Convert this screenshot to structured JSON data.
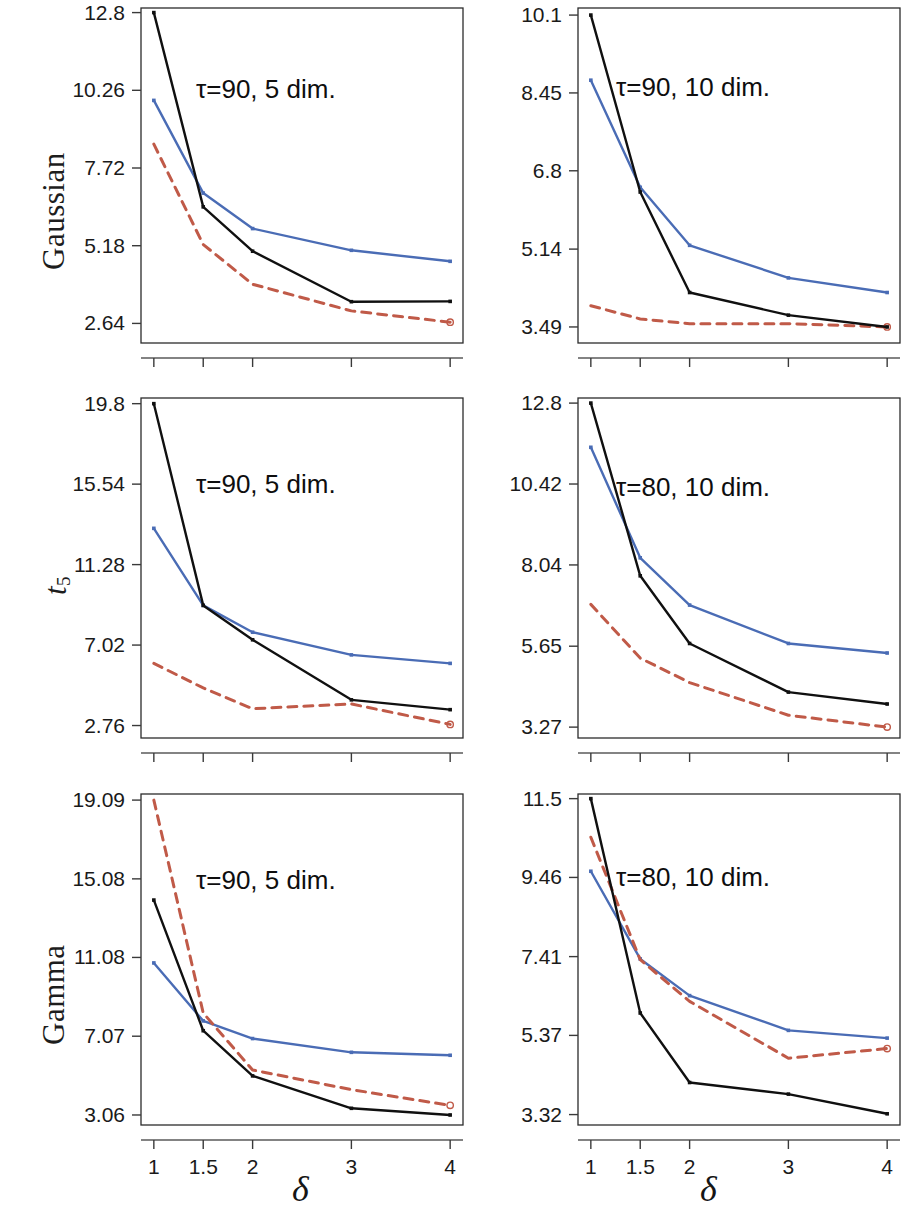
{
  "figure": {
    "row_labels": [
      "Gaussian",
      "t5",
      "Gamma"
    ],
    "x_axis_title": "δ",
    "colors": {
      "black": "#101010",
      "blue": "#4a6cb5",
      "red_dashed": "#c05a48",
      "frame": "#2b2b2b"
    }
  },
  "chart_data": [
    {
      "id": "gaussian-5dim",
      "type": "line",
      "row": "Gaussian",
      "column": "left",
      "title": "τ=90, 5 dim.",
      "xlabel": "δ",
      "ylabel": "",
      "x": [
        1,
        1.5,
        2,
        3,
        4
      ],
      "xtick_labels": [
        "1",
        "1.5",
        "2",
        "3",
        "4"
      ],
      "ytick_labels": [
        "2.64",
        "5.18",
        "7.72",
        "10.26",
        "12.8"
      ],
      "ytick_values": [
        2.64,
        5.18,
        7.72,
        10.26,
        12.8
      ],
      "ylim": [
        2.0,
        12.95
      ],
      "xlim": [
        0.87,
        4.13
      ],
      "grid": false,
      "legend": "none",
      "series": [
        {
          "name": "black-solid",
          "style": "solid",
          "color": "#101010",
          "values": [
            12.8,
            6.45,
            5.0,
            3.35,
            3.36
          ]
        },
        {
          "name": "blue-solid",
          "style": "solid",
          "color": "#4a6cb5",
          "values": [
            9.93,
            6.9,
            5.74,
            5.03,
            4.67
          ]
        },
        {
          "name": "red-dashed",
          "style": "dashed",
          "color": "#c05a48",
          "values": [
            8.5,
            5.22,
            3.92,
            3.05,
            2.68
          ]
        }
      ]
    },
    {
      "id": "gaussian-10dim",
      "type": "line",
      "row": "Gaussian",
      "column": "right",
      "title": "τ=90, 10 dim.",
      "xlabel": "δ",
      "ylabel": "",
      "x": [
        1,
        1.5,
        2,
        3,
        4
      ],
      "xtick_labels": [
        "1",
        "1.5",
        "2",
        "3",
        "4"
      ],
      "ytick_labels": [
        "3.49",
        "5.14",
        "6.8",
        "8.45",
        "10.1"
      ],
      "ytick_values": [
        3.49,
        5.14,
        6.8,
        8.45,
        10.1
      ],
      "ylim": [
        3.15,
        10.25
      ],
      "xlim": [
        0.87,
        4.13
      ],
      "grid": false,
      "legend": "none",
      "series": [
        {
          "name": "black-solid",
          "style": "solid",
          "color": "#101010",
          "values": [
            10.1,
            6.35,
            4.22,
            3.74,
            3.49
          ]
        },
        {
          "name": "blue-solid",
          "style": "solid",
          "color": "#4a6cb5",
          "values": [
            8.72,
            6.45,
            5.22,
            4.53,
            4.22
          ]
        },
        {
          "name": "red-dashed",
          "style": "dashed",
          "color": "#c05a48",
          "values": [
            3.94,
            3.66,
            3.56,
            3.56,
            3.49
          ]
        }
      ]
    },
    {
      "id": "t5-5dim",
      "type": "line",
      "row": "t5",
      "column": "left",
      "title": "τ=90, 5 dim.",
      "xlabel": "δ",
      "ylabel": "",
      "x": [
        1,
        1.5,
        2,
        3,
        4
      ],
      "xtick_labels": [
        "1",
        "1.5",
        "2",
        "3",
        "4"
      ],
      "ytick_labels": [
        "2.76",
        "7.02",
        "11.28",
        "15.54",
        "19.8"
      ],
      "ytick_values": [
        2.76,
        7.02,
        11.28,
        15.54,
        19.8
      ],
      "ylim": [
        2.1,
        20.1
      ],
      "xlim": [
        0.87,
        4.13
      ],
      "grid": false,
      "legend": "none",
      "series": [
        {
          "name": "black-solid",
          "style": "solid",
          "color": "#101010",
          "values": [
            19.8,
            9.12,
            7.3,
            4.12,
            3.6
          ]
        },
        {
          "name": "blue-solid",
          "style": "solid",
          "color": "#4a6cb5",
          "values": [
            13.2,
            9.12,
            7.7,
            6.5,
            6.05
          ]
        },
        {
          "name": "red-dashed",
          "style": "dashed",
          "color": "#c05a48",
          "values": [
            6.05,
            4.75,
            3.65,
            3.9,
            2.82
          ]
        }
      ]
    },
    {
      "id": "t5-10dim",
      "type": "line",
      "row": "t5",
      "column": "right",
      "title": "τ=80, 10 dim.",
      "xlabel": "δ",
      "ylabel": "",
      "x": [
        1,
        1.5,
        2,
        3,
        4
      ],
      "xtick_labels": [
        "1",
        "1.5",
        "2",
        "3",
        "4"
      ],
      "ytick_labels": [
        "3.27",
        "5.65",
        "8.04",
        "10.42",
        "12.8"
      ],
      "ytick_values": [
        3.27,
        5.65,
        8.04,
        10.42,
        12.8
      ],
      "ylim": [
        2.95,
        12.95
      ],
      "xlim": [
        0.87,
        4.13
      ],
      "grid": false,
      "legend": "none",
      "series": [
        {
          "name": "black-solid",
          "style": "solid",
          "color": "#101010",
          "values": [
            12.8,
            7.72,
            5.73,
            4.3,
            3.95
          ]
        },
        {
          "name": "blue-solid",
          "style": "solid",
          "color": "#4a6cb5",
          "values": [
            11.5,
            8.25,
            6.86,
            5.73,
            5.45
          ]
        },
        {
          "name": "red-dashed",
          "style": "dashed",
          "color": "#c05a48",
          "values": [
            6.88,
            5.3,
            4.58,
            3.62,
            3.27
          ]
        }
      ]
    },
    {
      "id": "gamma-5dim",
      "type": "line",
      "row": "Gamma",
      "column": "left",
      "title": "τ=90, 5 dim.",
      "xlabel": "δ",
      "ylabel": "",
      "x": [
        1,
        1.5,
        2,
        3,
        4
      ],
      "xtick_labels": [
        "1",
        "1.5",
        "2",
        "3",
        "4"
      ],
      "ytick_labels": [
        "3.06",
        "7.07",
        "11.08",
        "15.08",
        "19.09"
      ],
      "ytick_values": [
        3.06,
        7.07,
        11.08,
        15.08,
        19.09
      ],
      "ylim": [
        2.55,
        19.4
      ],
      "xlim": [
        0.87,
        4.13
      ],
      "grid": false,
      "legend": "none",
      "series": [
        {
          "name": "black-solid",
          "style": "solid",
          "color": "#101010",
          "values": [
            14.0,
            7.35,
            5.05,
            3.4,
            3.06
          ]
        },
        {
          "name": "blue-solid",
          "style": "solid",
          "color": "#4a6cb5",
          "values": [
            10.8,
            7.85,
            6.95,
            6.25,
            6.1
          ]
        },
        {
          "name": "red-dashed",
          "style": "dashed",
          "color": "#c05a48",
          "values": [
            19.09,
            8.25,
            5.35,
            4.35,
            3.55
          ]
        }
      ]
    },
    {
      "id": "gamma-10dim",
      "type": "line",
      "row": "Gamma",
      "column": "right",
      "title": "τ=80, 10 dim.",
      "xlabel": "δ",
      "ylabel": "",
      "x": [
        1,
        1.5,
        2,
        3,
        4
      ],
      "xtick_labels": [
        "1",
        "1.5",
        "2",
        "3",
        "4"
      ],
      "ytick_labels": [
        "3.32",
        "5.37",
        "7.41",
        "9.46",
        "11.5"
      ],
      "ytick_values": [
        3.32,
        5.37,
        7.41,
        9.46,
        11.5
      ],
      "ylim": [
        3.05,
        11.62
      ],
      "xlim": [
        0.87,
        4.13
      ],
      "grid": false,
      "legend": "none",
      "series": [
        {
          "name": "black-solid",
          "style": "solid",
          "color": "#101010",
          "values": [
            11.5,
            5.95,
            4.15,
            3.85,
            3.34
          ]
        },
        {
          "name": "blue-solid",
          "style": "solid",
          "color": "#4a6cb5",
          "values": [
            9.62,
            7.35,
            6.4,
            5.5,
            5.3
          ]
        },
        {
          "name": "red-dashed",
          "style": "dashed",
          "color": "#c05a48",
          "values": [
            10.5,
            7.33,
            6.25,
            4.78,
            5.03
          ]
        }
      ]
    }
  ]
}
